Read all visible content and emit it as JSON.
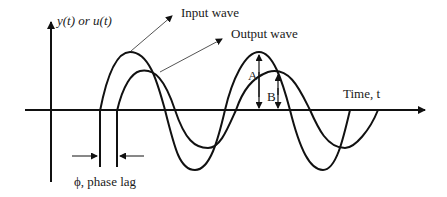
{
  "diagram": {
    "y_axis_label": "y(t) or u(t)",
    "x_axis_label": "Time, t",
    "input_wave_label": "Input wave",
    "output_wave_label": "Output wave",
    "amplitude_input_label": "A",
    "amplitude_output_label": "B",
    "phase_lag_label": "ϕ, phase lag",
    "colors": {
      "stroke": "#111111",
      "pointer": "#555555",
      "background": "#ffffff"
    }
  }
}
